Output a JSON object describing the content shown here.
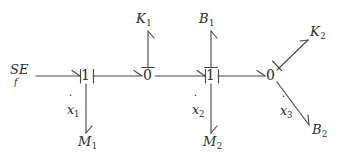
{
  "diagram": {
    "type": "bond-graph",
    "title": "",
    "stroke_color": "#4a4a4a",
    "text_color": "#2b2b2b",
    "background_color": "#ffffff",
    "source": {
      "name": "SE_f",
      "top": "SE",
      "bottom": "f"
    },
    "junctions": [
      {
        "id": "j1",
        "label": "1",
        "x": 86,
        "y": 76
      },
      {
        "id": "j2",
        "label": "0",
        "x": 148,
        "y": 76
      },
      {
        "id": "j3",
        "label": "1",
        "x": 211,
        "y": 76
      },
      {
        "id": "j4",
        "label": "0",
        "x": 271,
        "y": 76
      }
    ],
    "elements": [
      {
        "id": "k1",
        "letter": "K",
        "sub": "1",
        "x": 143,
        "y": 18
      },
      {
        "id": "b1",
        "letter": "B",
        "sub": "1",
        "x": 206,
        "y": 18
      },
      {
        "id": "k2",
        "letter": "K",
        "sub": "2",
        "x": 311,
        "y": 32
      },
      {
        "id": "m1",
        "letter": "M",
        "sub": "1",
        "x": 86,
        "y": 143
      },
      {
        "id": "m2",
        "letter": "M",
        "sub": "2",
        "x": 211,
        "y": 143
      },
      {
        "id": "b2",
        "letter": "B",
        "sub": "2",
        "x": 317,
        "y": 131
      }
    ],
    "flow_variables": [
      {
        "id": "xdot1",
        "letter": "x",
        "sub": "1",
        "x": 73,
        "y": 112
      },
      {
        "id": "xdot2",
        "letter": "x",
        "sub": "2",
        "x": 198,
        "y": 112
      },
      {
        "id": "xdot3",
        "letter": "x",
        "sub": "3",
        "x": 287,
        "y": 113
      }
    ],
    "bonds": [
      {
        "id": "bond-se-j1",
        "from": "SE_f",
        "to": "j1",
        "direction": "right"
      },
      {
        "id": "bond-j1-j2",
        "from": "j1",
        "to": "j2",
        "direction": "right"
      },
      {
        "id": "bond-j2-j3",
        "from": "j2",
        "to": "j3",
        "direction": "right"
      },
      {
        "id": "bond-j3-j4",
        "from": "j3",
        "to": "j4",
        "direction": "right"
      },
      {
        "id": "bond-j2-k1",
        "from": "j2",
        "to": "K1",
        "direction": "up"
      },
      {
        "id": "bond-j3-b1",
        "from": "j3",
        "to": "B1",
        "direction": "up"
      },
      {
        "id": "bond-j1-m1",
        "from": "j1",
        "to": "M1",
        "direction": "down"
      },
      {
        "id": "bond-j3-m2",
        "from": "j3",
        "to": "M2",
        "direction": "down"
      },
      {
        "id": "bond-j4-k2",
        "from": "j4",
        "to": "K2",
        "direction": "up-right"
      },
      {
        "id": "bond-j4-b2",
        "from": "j4",
        "to": "B2",
        "direction": "down-right"
      }
    ]
  }
}
